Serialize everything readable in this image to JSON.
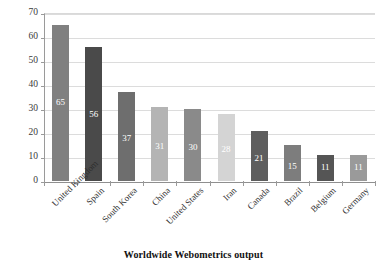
{
  "chart_data": {
    "type": "bar",
    "title": "",
    "caption": "Worldwide Webometrics output",
    "xlabel": "",
    "ylabel": "",
    "ylim": [
      0,
      70
    ],
    "ytick_step": 10,
    "yticks": [
      70,
      60,
      50,
      40,
      30,
      20,
      10,
      0
    ],
    "grid": true,
    "legend": "none",
    "categories": [
      "United Kingdom",
      "Spain",
      "South Korea",
      "China",
      "United States",
      "Iran",
      "Canada",
      "Brazil",
      "Belgium",
      "Germany"
    ],
    "values": [
      65,
      56,
      37,
      31,
      30,
      28,
      21,
      15,
      11,
      11
    ],
    "data_labels": [
      "65",
      "56",
      "37",
      "31",
      "30",
      "28",
      "21",
      "15",
      "11",
      "11"
    ],
    "bar_colors": [
      "#808080",
      "#4a4a4a",
      "#6e6e6e",
      "#b4b4b4",
      "#8a8a8a",
      "#d4d4d4",
      "#5e5e5e",
      "#7d7d7d",
      "#555555",
      "#9a9a9a"
    ],
    "data_label_color": "#ffffff"
  },
  "axis": {
    "line_color": "#9a9a9a",
    "grid_color": "#dcdcdc"
  }
}
